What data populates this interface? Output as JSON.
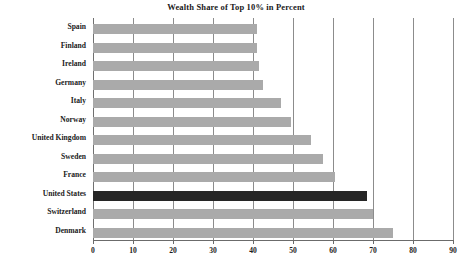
{
  "chart_data": {
    "type": "bar",
    "orientation": "horizontal",
    "title": "Wealth Share of Top 10% in Percent",
    "xlabel": "",
    "ylabel": "",
    "xlim": [
      0,
      90
    ],
    "xticks": [
      0,
      10,
      20,
      30,
      40,
      50,
      60,
      70,
      80,
      90
    ],
    "grid": true,
    "legend": false,
    "categories": [
      "Spain",
      "Finland",
      "Ireland",
      "Germany",
      "Italy",
      "Norway",
      "United Kingdom",
      "Sweden",
      "France",
      "United States",
      "Switzerland",
      "Denmark"
    ],
    "values": [
      41,
      41,
      41.5,
      42.5,
      47,
      49.5,
      54.5,
      57.5,
      60.5,
      68.5,
      70,
      75
    ],
    "highlighted_category": "United States",
    "colors": {
      "bar": "#aaaaaa",
      "bar_highlight": "#262626",
      "gridline": "#8c8c8c",
      "axis": "#6b6b6b",
      "text": "#1a1a1a",
      "background": "#ffffff"
    }
  }
}
